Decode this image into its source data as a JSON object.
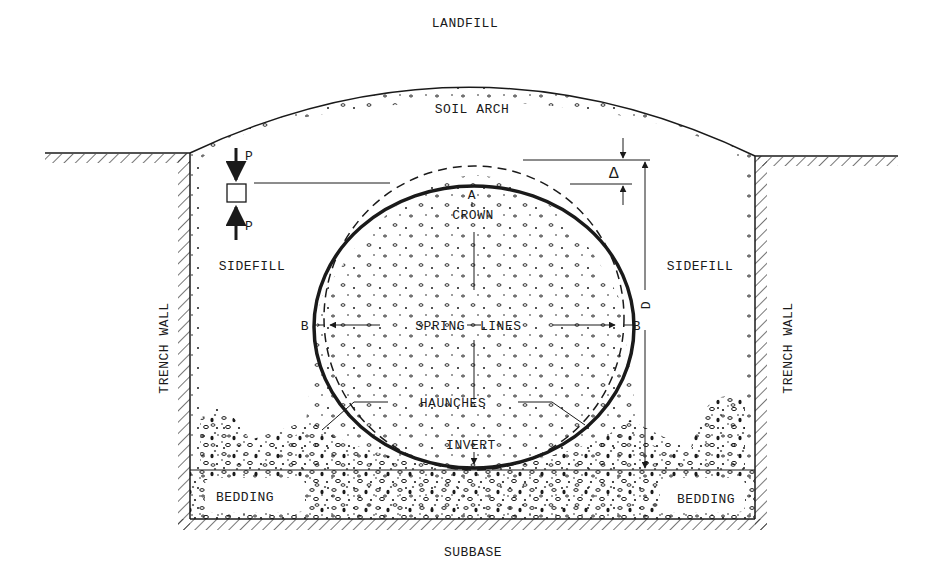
{
  "diagram": {
    "labels": {
      "landfill": "LANDFILL",
      "soil_arch": "SOIL ARCH",
      "sidefill_left": "SIDEFILL",
      "sidefill_right": "SIDEFILL",
      "trench_wall_left": "TRENCH WALL",
      "trench_wall_right": "TRENCH WALL",
      "crown_point": "A",
      "crown": "CROWN",
      "spring_lines_left": "SPRING",
      "spring_lines_right": "LINES",
      "spring_point_left": "B",
      "spring_point_right": "B",
      "haunches": "HAUNCHES",
      "invert": "INVERT",
      "bedding_left": "BEDDING",
      "bedding_right": "BEDDING",
      "subbase": "SUBBASE",
      "load_top": "P",
      "load_bottom": "P",
      "deflection": "Δ",
      "diameter": "D"
    },
    "colors": {
      "ink": "#1a1a1a",
      "paper": "#ffffff"
    }
  }
}
